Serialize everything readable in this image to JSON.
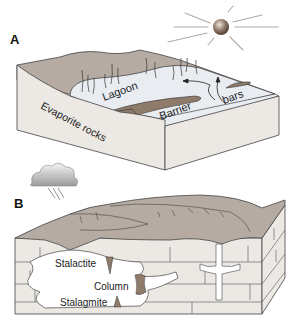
{
  "panels": [
    {
      "letter": "A",
      "labels": {
        "lagoon": "Lagoon",
        "barrier": "Barrier",
        "bars": "bars",
        "evaporite": "Evaporite rocks"
      }
    },
    {
      "letter": "B",
      "labels": {
        "stalactite": "Stalactite",
        "column": "Column",
        "stalagmite": "Stalagmite"
      }
    }
  ],
  "colors": {
    "land_top": "#b5aba2",
    "block_side": "#ece8e3",
    "lagoon_water": "#e9edf2",
    "sediment": "#8f7b6a",
    "evaporite": "#5a3a28",
    "outline": "#444444",
    "cave_void": "#ffffff",
    "sun": "#8a7566"
  },
  "icons": [
    "sun-icon",
    "rain-cloud-icon"
  ]
}
